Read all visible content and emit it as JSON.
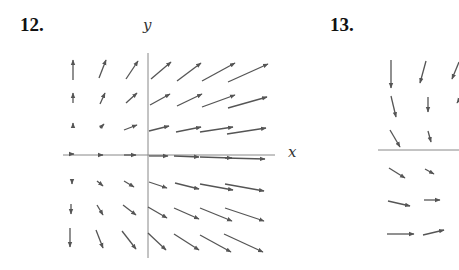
{
  "figures": [
    {
      "number": "12.",
      "number_pos": [
        20,
        14
      ],
      "x_label": "x",
      "y_label": "y",
      "x_label_pos": [
        288,
        144
      ],
      "y_label_pos": [
        143,
        18
      ],
      "axes": {
        "x_axis": [
          63,
          155,
          275,
          155
        ],
        "y_axis": [
          148,
          53,
          148,
          258
        ]
      },
      "arrows": [
        [
          73,
          80,
          73,
          60
        ],
        [
          99,
          78,
          106,
          60
        ],
        [
          126,
          79,
          138,
          61
        ],
        [
          151,
          79,
          171,
          62
        ],
        [
          177,
          81,
          201,
          63
        ],
        [
          202,
          81,
          235,
          63
        ],
        [
          228,
          82,
          268,
          64
        ],
        [
          73,
          103,
          73,
          93
        ],
        [
          100,
          104,
          105,
          93
        ],
        [
          126,
          103,
          137,
          93
        ],
        [
          150,
          105,
          170,
          94
        ],
        [
          177,
          106,
          202,
          94
        ],
        [
          202,
          107,
          235,
          95
        ],
        [
          228,
          108,
          267,
          97
        ],
        [
          73,
          127,
          73,
          123
        ],
        [
          100,
          128,
          104,
          124
        ],
        [
          124,
          130,
          137,
          125
        ],
        [
          149,
          131,
          169,
          126
        ],
        [
          176,
          132,
          201,
          127
        ],
        [
          200,
          132,
          233,
          127
        ],
        [
          227,
          134,
          266,
          128
        ],
        [
          70,
          154,
          74,
          154
        ],
        [
          98,
          155,
          103,
          155
        ],
        [
          124,
          155,
          136,
          155
        ],
        [
          149,
          156,
          168,
          156
        ],
        [
          174,
          156,
          199,
          157
        ],
        [
          200,
          157,
          232,
          158
        ],
        [
          225,
          158,
          265,
          159
        ],
        [
          72,
          180,
          72,
          184
        ],
        [
          97,
          181,
          103,
          186
        ],
        [
          124,
          181,
          134,
          187
        ],
        [
          149,
          182,
          167,
          188
        ],
        [
          175,
          183,
          199,
          189
        ],
        [
          200,
          184,
          233,
          190
        ],
        [
          225,
          184,
          264,
          191
        ],
        [
          71,
          204,
          71,
          214
        ],
        [
          97,
          205,
          103,
          215
        ],
        [
          123,
          205,
          136,
          215
        ],
        [
          148,
          207,
          167,
          218
        ],
        [
          174,
          208,
          199,
          219
        ],
        [
          200,
          208,
          232,
          221
        ],
        [
          225,
          208,
          264,
          221
        ],
        [
          70,
          228,
          70,
          247
        ],
        [
          96,
          230,
          103,
          248
        ],
        [
          122,
          231,
          136,
          249
        ],
        [
          148,
          233,
          166,
          250
        ],
        [
          174,
          234,
          199,
          250
        ],
        [
          200,
          235,
          231,
          252
        ],
        [
          224,
          234,
          263,
          252
        ]
      ],
      "arrow_color": "#555555"
    },
    {
      "number": "13.",
      "number_pos": [
        330,
        14
      ],
      "axes": {
        "x_axis": [
          378,
          150,
          459,
          150
        ]
      },
      "arrows": [
        [
          391,
          60,
          391,
          88
        ],
        [
          426,
          61,
          420,
          83
        ],
        [
          459,
          62,
          452,
          79
        ],
        [
          391,
          96,
          396,
          117
        ],
        [
          428,
          97,
          428,
          112
        ],
        [
          459,
          100,
          457,
          103
        ],
        [
          390,
          130,
          400,
          147
        ],
        [
          428,
          131,
          431,
          142
        ],
        [
          389,
          168,
          405,
          178
        ],
        [
          425,
          169,
          434,
          174
        ],
        [
          388,
          201,
          410,
          206
        ],
        [
          424,
          200,
          440,
          200
        ],
        [
          387,
          234,
          414,
          234
        ],
        [
          423,
          235,
          444,
          230
        ]
      ],
      "arrow_color": "#555555"
    }
  ]
}
